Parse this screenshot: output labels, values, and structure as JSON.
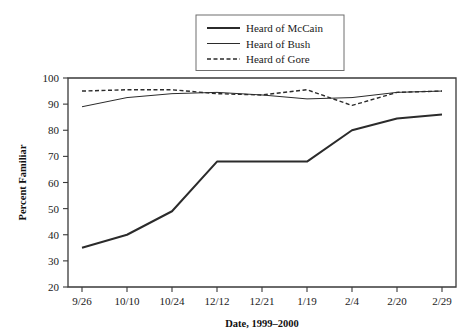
{
  "chart_data": {
    "type": "line",
    "title": "",
    "xlabel": "Date, 1999–2000",
    "ylabel": "Percent Familiar",
    "categories": [
      "9/26",
      "10/10",
      "10/24",
      "12/12",
      "12/21",
      "1/19",
      "2/4",
      "2/20",
      "2/29"
    ],
    "ylim": [
      20,
      100
    ],
    "yticks": [
      20,
      30,
      40,
      50,
      60,
      70,
      80,
      90,
      100
    ],
    "ytick_labels": [
      "20",
      "30",
      "40",
      "50",
      "60",
      "70",
      "80",
      "90",
      "100"
    ],
    "grid": false,
    "legend_position": "top-center",
    "series": [
      {
        "name": "Heard of McCain",
        "style": "solid",
        "width": 2.0,
        "color": "#2b2b2b",
        "values": [
          35,
          40,
          49,
          68,
          68,
          68,
          80,
          84.5,
          86
        ]
      },
      {
        "name": "Heard of Bush",
        "style": "solid",
        "width": 1.0,
        "color": "#2b2b2b",
        "values": [
          89,
          92.5,
          94,
          94.5,
          93.5,
          92,
          92.5,
          94.5,
          95
        ]
      },
      {
        "name": "Heard of Gore",
        "style": "dashed",
        "width": 1.4,
        "color": "#2b2b2b",
        "values": [
          95,
          95.5,
          95.5,
          94,
          93.5,
          95.5,
          89.5,
          94.5,
          95
        ]
      }
    ]
  },
  "legend": {
    "items": [
      {
        "label": "Heard of McCain"
      },
      {
        "label": "Heard of Bush"
      },
      {
        "label": "Heard of Gore"
      }
    ]
  },
  "axes": {
    "x_title": "Date, 1999–2000",
    "y_title": "Percent Familiar"
  }
}
